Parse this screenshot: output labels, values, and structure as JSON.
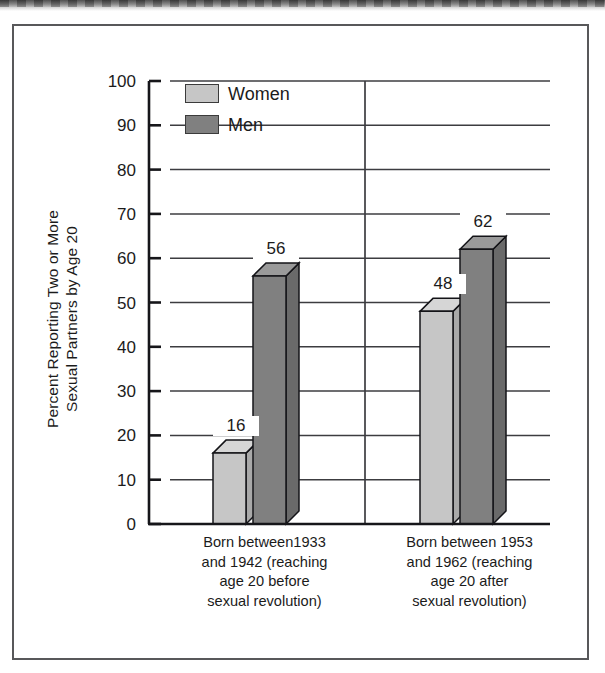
{
  "figure": {
    "has_outer_frame": true,
    "scan_artifact": "top-edge-smudge"
  },
  "chart_data": {
    "type": "bar",
    "title": "",
    "subtitle": "",
    "xlabel": "",
    "ylabel": "Percent Reporting Two or More Sexual Partners by Age 20",
    "ylabel_lines": [
      "Percent Reporting Two or More",
      "Sexual Partners by Age 20"
    ],
    "categories": [
      "Born between1933 and 1942 (reaching age 20 before sexual revolution)",
      "Born between 1953 and 1962 (reaching age 20 after sexual revolution)"
    ],
    "category_lines": [
      [
        "Born between1933",
        "and 1942 (reaching",
        "age 20 before",
        "sexual revolution)"
      ],
      [
        "Born between 1953",
        "and 1962 (reaching",
        "age 20 after",
        "sexual revolution)"
      ]
    ],
    "series": [
      {
        "name": "Women",
        "color": "#c6c6c6",
        "values": [
          16,
          48
        ]
      },
      {
        "name": "Men",
        "color": "#808080",
        "values": [
          56,
          62
        ]
      }
    ],
    "ylim": [
      0,
      100
    ],
    "ytick_step": 10,
    "yticks": [
      100,
      90,
      80,
      70,
      60,
      50,
      40,
      30,
      20,
      10,
      0
    ],
    "ytick_labels": [
      "100",
      "90",
      "80",
      "70",
      "60",
      "50",
      "40",
      "30",
      "20",
      "10",
      "0"
    ],
    "grid": "horizontal-plus-category-divider",
    "legend_position": "upper-left-inside",
    "three_d": true,
    "data_labels": [
      "16",
      "56",
      "48",
      "62"
    ]
  },
  "legend": {
    "items": [
      {
        "label": "Women",
        "color": "#c6c6c6"
      },
      {
        "label": "Men",
        "color": "#808080"
      }
    ]
  },
  "colors": {
    "women_front": "#c6c6c6",
    "women_top": "#d6d6d6",
    "women_side": "#a9a9a9",
    "men_front": "#808080",
    "men_top": "#9a9a9a",
    "men_side": "#6a6a6a",
    "axis": "#16161a",
    "grid": "#3c3c40",
    "frame": "#58585a",
    "text": "#1b1b1b"
  }
}
